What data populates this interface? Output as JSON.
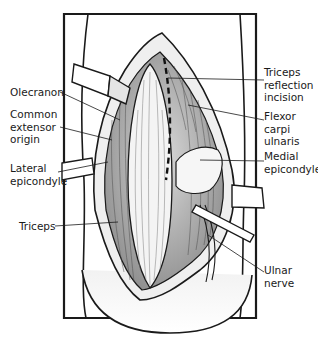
{
  "figure": {
    "labels_left": [
      {
        "id": "olecranon",
        "lines": [
          "Olecranon"
        ],
        "x": 10,
        "y": 86
      },
      {
        "id": "common-extensor-origin",
        "lines": [
          "Common",
          "extensor",
          "origin"
        ],
        "x": 10,
        "y": 108
      },
      {
        "id": "lateral-epicondyle",
        "lines": [
          "Lateral",
          "epicondyle"
        ],
        "x": 10,
        "y": 160
      },
      {
        "id": "triceps",
        "lines": [
          "Triceps"
        ],
        "x": 19,
        "y": 220
      }
    ],
    "labels_right": [
      {
        "id": "triceps-reflection-incision",
        "lines": [
          "Triceps",
          "reflection",
          "incision"
        ],
        "x": 264,
        "y": 65
      },
      {
        "id": "flexor-carpi-ulnaris",
        "lines": [
          "Flexor",
          "carpi",
          "ulnaris"
        ],
        "x": 264,
        "y": 108
      },
      {
        "id": "medial-epicondyle",
        "lines": [
          "Medial",
          "epicondyle"
        ],
        "x": 264,
        "y": 148
      },
      {
        "id": "ulnar-nerve",
        "lines": [
          "Ulnar",
          "nerve"
        ],
        "x": 264,
        "y": 262
      }
    ],
    "colors": {
      "ink": "#1a1a1a",
      "shade": "#9a9a9a",
      "background": "#ffffff"
    }
  }
}
